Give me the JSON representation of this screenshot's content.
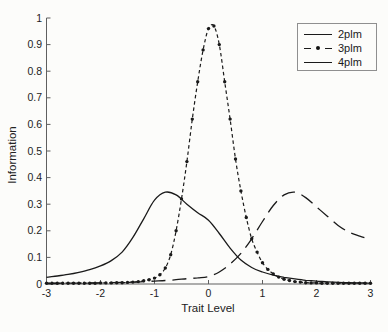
{
  "figure": {
    "background": "#fcfcfa",
    "curve_color": "#1a1a1a",
    "axis_color": "#5f5f5f",
    "tick_label_color": "#222222",
    "legend_border_color": "#8f8f8f"
  },
  "legend": {
    "position": "upper right",
    "entries": [
      {
        "label": "2plm",
        "line_style": "solid",
        "marker": "none"
      },
      {
        "label": "3plm",
        "line_style": "dashed",
        "marker": "dot"
      },
      {
        "label": "4plm",
        "line_style": "long-dash",
        "marker": "none"
      }
    ]
  },
  "chart_data": {
    "type": "line",
    "title": "",
    "xlabel": "Trait Level",
    "ylabel": "Information",
    "xlim": [
      -3,
      3
    ],
    "ylim": [
      0,
      1
    ],
    "x_ticks": [
      "-3",
      "-2",
      "-1",
      "0",
      "1",
      "2",
      "3"
    ],
    "y_ticks": [
      "0",
      "0.1",
      "0.2",
      "0.3",
      "0.4",
      "0.5",
      "0.6",
      "0.7",
      "0.8",
      "0.9",
      "1"
    ],
    "grid": false,
    "box": false,
    "legend_position": "upper right",
    "series": [
      {
        "name": "2plm",
        "style": "solid",
        "marker": "none",
        "peak": {
          "x": -0.85,
          "y": 0.345
        },
        "points": [
          [
            -3,
            0.025
          ],
          [
            -2.8,
            0.03
          ],
          [
            -2.6,
            0.036
          ],
          [
            -2.4,
            0.044
          ],
          [
            -2.2,
            0.054
          ],
          [
            -2,
            0.068
          ],
          [
            -1.8,
            0.088
          ],
          [
            -1.6,
            0.12
          ],
          [
            -1.4,
            0.175
          ],
          [
            -1.2,
            0.245
          ],
          [
            -1,
            0.315
          ],
          [
            -0.8,
            0.345
          ],
          [
            -0.6,
            0.335
          ],
          [
            -0.4,
            0.3
          ],
          [
            -0.2,
            0.268
          ],
          [
            0,
            0.24
          ],
          [
            0.2,
            0.19
          ],
          [
            0.4,
            0.135
          ],
          [
            0.6,
            0.09
          ],
          [
            0.8,
            0.062
          ],
          [
            1,
            0.045
          ],
          [
            1.2,
            0.033
          ],
          [
            1.4,
            0.025
          ],
          [
            1.6,
            0.019
          ],
          [
            1.8,
            0.014
          ],
          [
            2,
            0.011
          ],
          [
            2.2,
            0.008
          ],
          [
            2.4,
            0.006
          ],
          [
            2.6,
            0.005
          ],
          [
            2.8,
            0.004
          ],
          [
            3,
            0.003
          ]
        ]
      },
      {
        "name": "3plm",
        "style": "dashed",
        "marker": "dot",
        "peak": {
          "x": 0.05,
          "y": 0.97
        },
        "points": [
          [
            -3,
            0.003
          ],
          [
            -2.9,
            0.003
          ],
          [
            -2.8,
            0.003
          ],
          [
            -2.7,
            0.003
          ],
          [
            -2.6,
            0.003
          ],
          [
            -2.5,
            0.003
          ],
          [
            -2.4,
            0.003
          ],
          [
            -2.3,
            0.003
          ],
          [
            -2.2,
            0.003
          ],
          [
            -2.1,
            0.003
          ],
          [
            -2,
            0.004
          ],
          [
            -1.9,
            0.004
          ],
          [
            -1.8,
            0.004
          ],
          [
            -1.7,
            0.005
          ],
          [
            -1.6,
            0.005
          ],
          [
            -1.5,
            0.006
          ],
          [
            -1.4,
            0.007
          ],
          [
            -1.3,
            0.009
          ],
          [
            -1.2,
            0.012
          ],
          [
            -1.1,
            0.016
          ],
          [
            -1,
            0.022
          ],
          [
            -0.9,
            0.035
          ],
          [
            -0.8,
            0.06
          ],
          [
            -0.7,
            0.11
          ],
          [
            -0.6,
            0.2
          ],
          [
            -0.5,
            0.32
          ],
          [
            -0.4,
            0.46
          ],
          [
            -0.3,
            0.62
          ],
          [
            -0.2,
            0.76
          ],
          [
            -0.1,
            0.88
          ],
          [
            0,
            0.96
          ],
          [
            0.1,
            0.97
          ],
          [
            0.2,
            0.9
          ],
          [
            0.3,
            0.76
          ],
          [
            0.4,
            0.62
          ],
          [
            0.5,
            0.47
          ],
          [
            0.6,
            0.35
          ],
          [
            0.7,
            0.25
          ],
          [
            0.8,
            0.17
          ],
          [
            0.9,
            0.12
          ],
          [
            1,
            0.08
          ],
          [
            1.1,
            0.055
          ],
          [
            1.2,
            0.038
          ],
          [
            1.3,
            0.026
          ],
          [
            1.4,
            0.018
          ],
          [
            1.5,
            0.013
          ],
          [
            1.6,
            0.009
          ],
          [
            1.7,
            0.007
          ],
          [
            1.8,
            0.005
          ],
          [
            1.9,
            0.004
          ],
          [
            2,
            0.004
          ],
          [
            2.1,
            0.003
          ],
          [
            2.2,
            0.003
          ],
          [
            2.3,
            0.003
          ],
          [
            2.4,
            0.003
          ],
          [
            2.5,
            0.003
          ],
          [
            2.6,
            0.003
          ],
          [
            2.7,
            0.003
          ],
          [
            2.8,
            0.003
          ],
          [
            2.9,
            0.003
          ],
          [
            3,
            0.003
          ]
        ]
      },
      {
        "name": "4plm",
        "style": "long-dash",
        "marker": "none",
        "peak": {
          "x": 1.55,
          "y": 0.345
        },
        "points": [
          [
            -3,
            0.002
          ],
          [
            -2.8,
            0.002
          ],
          [
            -2.6,
            0.003
          ],
          [
            -2.4,
            0.003
          ],
          [
            -2.2,
            0.004
          ],
          [
            -2,
            0.004
          ],
          [
            -1.8,
            0.005
          ],
          [
            -1.6,
            0.006
          ],
          [
            -1.4,
            0.007
          ],
          [
            -1.2,
            0.009
          ],
          [
            -1,
            0.011
          ],
          [
            -0.8,
            0.013
          ],
          [
            -0.6,
            0.016
          ],
          [
            -0.4,
            0.02
          ],
          [
            -0.2,
            0.023
          ],
          [
            0,
            0.028
          ],
          [
            0.2,
            0.045
          ],
          [
            0.4,
            0.075
          ],
          [
            0.6,
            0.115
          ],
          [
            0.8,
            0.17
          ],
          [
            1,
            0.235
          ],
          [
            1.2,
            0.295
          ],
          [
            1.4,
            0.335
          ],
          [
            1.6,
            0.345
          ],
          [
            1.8,
            0.325
          ],
          [
            2,
            0.29
          ],
          [
            2.2,
            0.255
          ],
          [
            2.4,
            0.22
          ],
          [
            2.6,
            0.195
          ],
          [
            2.8,
            0.18
          ],
          [
            3,
            0.168
          ]
        ]
      }
    ]
  }
}
